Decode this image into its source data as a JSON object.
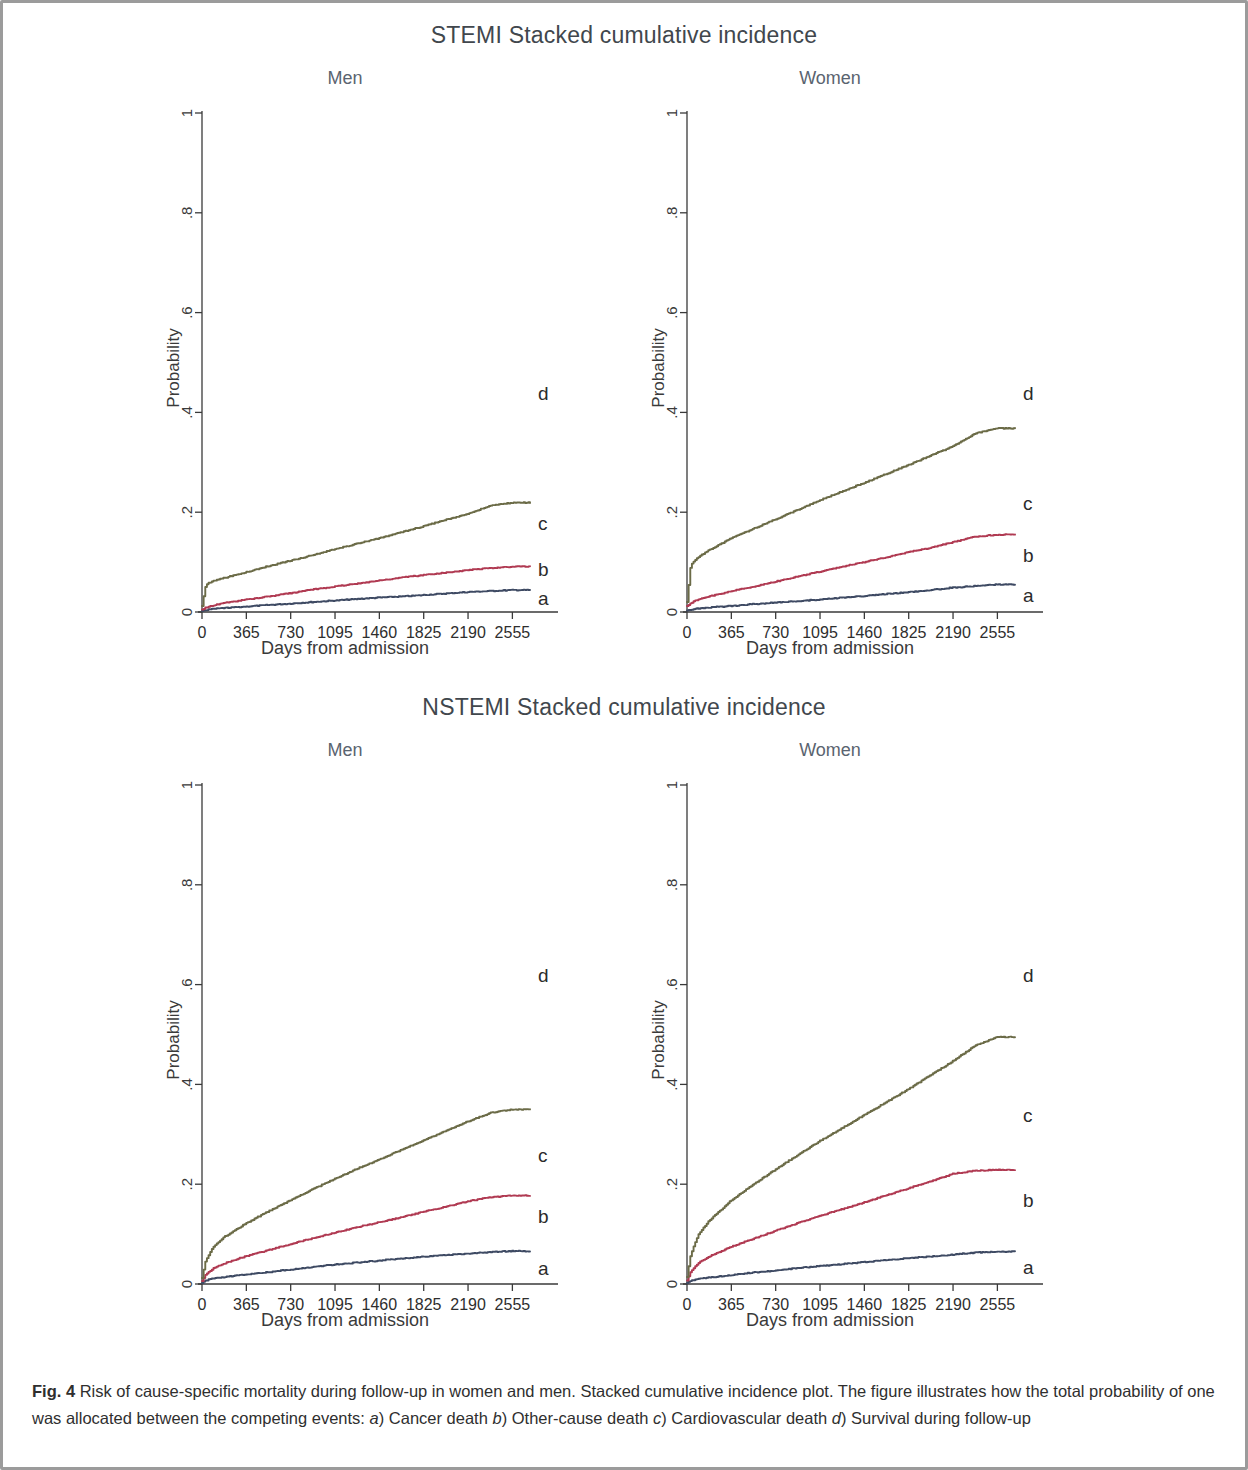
{
  "figure": {
    "caption_label": "Fig. 4",
    "caption_text_1": "Risk of cause-specific mortality during follow-up in women and men. Stacked cumulative incidence plot. The figure illustrates how the total probability of one was allocated between the competing events: ",
    "caption_item_a_mark": "a",
    "caption_item_a_text": ") Cancer death ",
    "caption_item_b_mark": "b",
    "caption_item_b_text": ") Other-cause death ",
    "caption_item_c_mark": "c",
    "caption_item_c_text": ") Cardiovascular death ",
    "caption_item_d_mark": "d",
    "caption_item_d_text": ") Survival during follow-up"
  },
  "sections": [
    {
      "title": "STEMI Stacked cumulative incidence"
    },
    {
      "title": "NSTEMI Stacked cumulative incidence"
    }
  ],
  "panels": {
    "stemi_men": {
      "title": "Men",
      "ylabel": "Probability",
      "xlabel": "Days from admission"
    },
    "stemi_women": {
      "title": "Women",
      "ylabel": "Probability",
      "xlabel": "Days from admission"
    },
    "nstemi_men": {
      "title": "Men",
      "ylabel": "Probability",
      "xlabel": "Days from admission"
    },
    "nstemi_women": {
      "title": "Women",
      "ylabel": "Probability",
      "xlabel": "Days from admission"
    }
  },
  "colors": {
    "curve_a": "#3e4a63",
    "curve_b": "#b03a52",
    "curve_c": "#6b6b47",
    "axis": "#3a3a3a",
    "frame": "#9b9b9b",
    "title": "#41474d",
    "panel_title": "#5a6470"
  },
  "axes": {
    "y_ticks": [
      "0",
      ".2",
      ".4",
      ".6",
      ".8",
      "1"
    ],
    "y_tick_values": [
      0,
      0.2,
      0.4,
      0.6,
      0.8,
      1
    ],
    "x_ticks": [
      "0",
      "365",
      "730",
      "1095",
      "1460",
      "1825",
      "2190",
      "2555"
    ],
    "x_tick_values": [
      0,
      365,
      730,
      1095,
      1460,
      1825,
      2190,
      2555
    ],
    "xlim": [
      0,
      2700
    ],
    "ylim": [
      0,
      1
    ]
  },
  "curve_labels": {
    "a": "a",
    "b": "b",
    "c": "c",
    "d": "d"
  },
  "chart_data": {
    "type": "line",
    "xlabel": "Days from admission",
    "ylabel": "Probability",
    "xlim": [
      0,
      2700
    ],
    "ylim": [
      0,
      1
    ],
    "grid": false,
    "legend": "inline curve labels at right edge (a, b, c, d)",
    "legend_entries": [
      {
        "mark": "a",
        "name": "Cancer death",
        "color": "#3e4a63"
      },
      {
        "mark": "b",
        "name": "Other-cause death",
        "color": "#b03a52"
      },
      {
        "mark": "c",
        "name": "Cardiovascular death",
        "color": "#6b6b47"
      },
      {
        "mark": "d",
        "name": "Survival during follow-up",
        "color": "none"
      }
    ],
    "x": [
      0,
      30,
      90,
      180,
      365,
      547,
      730,
      912,
      1095,
      1277,
      1460,
      1642,
      1825,
      2007,
      2190,
      2372,
      2555,
      2700
    ],
    "panels": [
      {
        "name": "STEMI Men",
        "section": "STEMI Stacked cumulative incidence",
        "sex": "Men",
        "series": [
          {
            "name": "a",
            "label": "Cancer death",
            "color": "#3e4a63",
            "values": [
              0.002,
              0.004,
              0.006,
              0.008,
              0.011,
              0.014,
              0.017,
              0.02,
              0.023,
              0.026,
              0.029,
              0.031,
              0.034,
              0.037,
              0.04,
              0.042,
              0.044,
              0.044
            ]
          },
          {
            "name": "b",
            "label": "+ Other-cause death",
            "color": "#b03a52",
            "values": [
              0.005,
              0.009,
              0.013,
              0.018,
              0.025,
              0.031,
              0.038,
              0.045,
              0.051,
              0.057,
              0.063,
              0.069,
              0.074,
              0.079,
              0.084,
              0.088,
              0.091,
              0.091
            ]
          },
          {
            "name": "c",
            "label": "+ Cardiovascular death",
            "color": "#6b6b47",
            "values": [
              0.012,
              0.055,
              0.062,
              0.068,
              0.08,
              0.092,
              0.103,
              0.114,
              0.126,
              0.137,
              0.148,
              0.16,
              0.172,
              0.185,
              0.197,
              0.213,
              0.219,
              0.219
            ]
          }
        ],
        "final_values": {
          "a": 0.044,
          "b": 0.091,
          "c": 0.219,
          "d_survival": 0.781
        }
      },
      {
        "name": "STEMI Women",
        "section": "STEMI Stacked cumulative incidence",
        "sex": "Women",
        "series": [
          {
            "name": "a",
            "label": "Cancer death",
            "color": "#3e4a63",
            "values": [
              0.003,
              0.005,
              0.007,
              0.009,
              0.012,
              0.016,
              0.019,
              0.022,
              0.025,
              0.029,
              0.032,
              0.036,
              0.04,
              0.044,
              0.049,
              0.052,
              0.055,
              0.055
            ]
          },
          {
            "name": "b",
            "label": "+ Other-cause death",
            "color": "#b03a52",
            "values": [
              0.012,
              0.018,
              0.025,
              0.031,
              0.042,
              0.051,
              0.061,
              0.071,
              0.081,
              0.091,
              0.1,
              0.11,
              0.12,
              0.129,
              0.14,
              0.151,
              0.155,
              0.155
            ]
          },
          {
            "name": "c",
            "label": "+ Cardiovascular death",
            "color": "#6b6b47",
            "values": [
              0.02,
              0.095,
              0.11,
              0.124,
              0.148,
              0.167,
              0.186,
              0.205,
              0.224,
              0.242,
              0.259,
              0.277,
              0.295,
              0.314,
              0.332,
              0.358,
              0.368,
              0.368
            ]
          }
        ],
        "final_values": {
          "a": 0.055,
          "b": 0.155,
          "c": 0.368,
          "d_survival": 0.632
        }
      },
      {
        "name": "NSTEMI Men",
        "section": "NSTEMI Stacked cumulative incidence",
        "sex": "Men",
        "series": [
          {
            "name": "a",
            "label": "Cancer death",
            "color": "#3e4a63",
            "values": [
              0.002,
              0.007,
              0.011,
              0.014,
              0.019,
              0.024,
              0.029,
              0.034,
              0.039,
              0.043,
              0.047,
              0.051,
              0.055,
              0.058,
              0.061,
              0.064,
              0.066,
              0.066
            ]
          },
          {
            "name": "b",
            "label": "+ Other-cause death",
            "color": "#b03a52",
            "values": [
              0.006,
              0.02,
              0.031,
              0.041,
              0.056,
              0.068,
              0.08,
              0.092,
              0.103,
              0.114,
              0.124,
              0.134,
              0.145,
              0.155,
              0.166,
              0.174,
              0.177,
              0.177
            ]
          },
          {
            "name": "c",
            "label": "+ Cardiovascular death",
            "color": "#6b6b47",
            "values": [
              0.012,
              0.048,
              0.074,
              0.094,
              0.122,
              0.146,
              0.168,
              0.19,
              0.211,
              0.231,
              0.25,
              0.269,
              0.288,
              0.307,
              0.326,
              0.343,
              0.35,
              0.35
            ]
          }
        ],
        "final_values": {
          "a": 0.066,
          "b": 0.177,
          "c": 0.35,
          "d_survival": 0.65
        }
      },
      {
        "name": "NSTEMI Women",
        "section": "NSTEMI Stacked cumulative incidence",
        "sex": "Women",
        "series": [
          {
            "name": "a",
            "label": "Cancer death",
            "color": "#3e4a63",
            "values": [
              0.002,
              0.006,
              0.01,
              0.013,
              0.018,
              0.023,
              0.027,
              0.032,
              0.036,
              0.04,
              0.044,
              0.048,
              0.052,
              0.055,
              0.059,
              0.063,
              0.065,
              0.065
            ]
          },
          {
            "name": "b",
            "label": "+ Other-cause death",
            "color": "#b03a52",
            "values": [
              0.007,
              0.026,
              0.042,
              0.055,
              0.075,
              0.091,
              0.107,
              0.122,
              0.137,
              0.15,
              0.164,
              0.178,
              0.192,
              0.206,
              0.221,
              0.227,
              0.229,
              0.229
            ]
          },
          {
            "name": "c",
            "label": "+ Cardiovascular death",
            "color": "#6b6b47",
            "values": [
              0.014,
              0.06,
              0.098,
              0.127,
              0.168,
              0.2,
              0.23,
              0.259,
              0.287,
              0.313,
              0.339,
              0.365,
              0.391,
              0.419,
              0.447,
              0.478,
              0.495,
              0.495
            ]
          }
        ],
        "final_values": {
          "a": 0.065,
          "b": 0.229,
          "c": 0.495,
          "d_survival": 0.505
        }
      }
    ]
  }
}
